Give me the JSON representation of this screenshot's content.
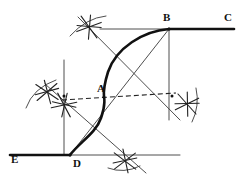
{
  "figure": {
    "background_color": "#ffffff",
    "ink_color": "#111111",
    "construction_color": "#3a3a3a",
    "canvas": {
      "width": 247,
      "height": 185
    }
  },
  "labels": [
    {
      "name": "point-label-a",
      "text": "A",
      "x": 97,
      "y": 92
    },
    {
      "name": "point-label-b",
      "text": "B",
      "x": 163,
      "y": 21
    },
    {
      "name": "point-label-c",
      "text": "C",
      "x": 224,
      "y": 21
    },
    {
      "name": "point-label-d",
      "text": "D",
      "x": 73,
      "y": 167
    },
    {
      "name": "point-label-e",
      "text": "E",
      "x": 11,
      "y": 163
    }
  ],
  "points": [
    {
      "name": "point-a",
      "id": "A",
      "x": 104,
      "y": 97,
      "role": "inflection-tangent-point"
    },
    {
      "name": "point-b",
      "id": "B",
      "x": 169,
      "y": 29,
      "role": "upper-end-point"
    },
    {
      "name": "point-d",
      "id": "D",
      "x": 70,
      "y": 155,
      "role": "lower-end-point"
    },
    {
      "name": "point-center-upper",
      "id": "O1",
      "x": 172,
      "y": 96,
      "role": "upper-arc-center"
    },
    {
      "name": "point-center-lower",
      "id": "O2",
      "x": 64,
      "y": 96,
      "role": "lower-arc-center"
    }
  ],
  "heavy_lines": [
    {
      "name": "line-bc",
      "label": "B to C",
      "x1": 169,
      "y1": 29,
      "x2": 234,
      "y2": 29
    },
    {
      "name": "line-ed",
      "label": "E to D",
      "x1": 10,
      "y1": 155,
      "x2": 70,
      "y2": 155
    }
  ],
  "construction_lines": [
    {
      "name": "construction-top-horizontal",
      "x1": 100,
      "y1": 29,
      "x2": 169,
      "y2": 29
    },
    {
      "name": "construction-bottom-horizontal",
      "x1": 70,
      "y1": 155,
      "x2": 180,
      "y2": 155
    },
    {
      "name": "construction-vertical-left",
      "x1": 64,
      "y1": 60,
      "x2": 64,
      "y2": 155
    },
    {
      "name": "construction-vertical-right",
      "x1": 169,
      "y1": 29,
      "x2": 169,
      "y2": 120
    },
    {
      "name": "construction-diagonal-db",
      "x1": 70,
      "y1": 155,
      "x2": 169,
      "y2": 29
    },
    {
      "name": "construction-diagonal-upper-left",
      "x1": 78,
      "y1": 17,
      "x2": 180,
      "y2": 120
    },
    {
      "name": "construction-diagonal-lower-right",
      "x1": 45,
      "y1": 84,
      "x2": 146,
      "y2": 173
    }
  ],
  "dashed_lines": [
    {
      "name": "dashed-bisector-through-a",
      "x1": 62,
      "y1": 100,
      "x2": 176,
      "y2": 93
    }
  ],
  "curve": {
    "name": "ogee-curve",
    "label": "Reverse S curve D-A-B",
    "path": "M 70 155 C 80 142 96 133 101 118 C 106 104 104 97 104 97 C 104 97 103 88 108 72 C 116 48 143 31 169 29"
  },
  "arc_marks": [
    {
      "name": "arc-mark-top",
      "x": 89,
      "y": 27,
      "rotation": 12
    },
    {
      "name": "arc-mark-left-upper",
      "x": 47,
      "y": 92,
      "rotation": -8
    },
    {
      "name": "arc-mark-left-lower",
      "x": 64,
      "y": 105,
      "rotation": 20
    },
    {
      "name": "arc-mark-right",
      "x": 187,
      "y": 104,
      "rotation": 6
    },
    {
      "name": "arc-mark-bottom",
      "x": 125,
      "y": 161,
      "rotation": -5
    }
  ],
  "compass_arcs": [
    {
      "name": "compass-arc-top",
      "path": "M 70 36 Q 86 18 106 16"
    },
    {
      "name": "compass-arc-left",
      "path": "M 26 108 Q 33 88 56 80"
    },
    {
      "name": "compass-arc-right",
      "path": "M 196 88 Q 200 106 192 122"
    },
    {
      "name": "compass-arc-bottom",
      "path": "M 108 168 Q 124 174 140 166"
    }
  ]
}
